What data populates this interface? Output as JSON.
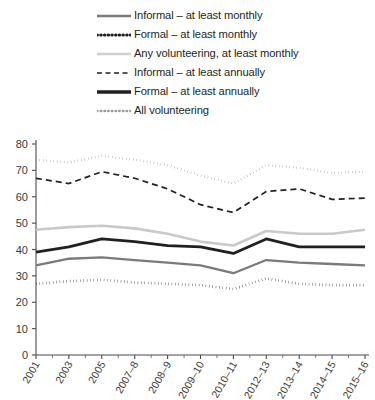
{
  "chart_data": {
    "type": "line",
    "title": "",
    "xlabel": "",
    "ylabel": "",
    "ylim": [
      0,
      80
    ],
    "ytick_step": 10,
    "grid": false,
    "legend_position": "top",
    "yticks": [
      "0",
      "10",
      "20",
      "30",
      "40",
      "50",
      "60",
      "70",
      "80"
    ],
    "categories": [
      "2001",
      "2003",
      "2005",
      "2007-8",
      "2008-9",
      "2009-10",
      "2010-11",
      "2012-13",
      "2013-14",
      "2014-15",
      "2015-16"
    ],
    "x_tick_labels": [
      "2001",
      "2003",
      "2005",
      "2007–8",
      "2008–9",
      "2009–10",
      "2010–11",
      "2012–13",
      "2013–14",
      "2014–15",
      "2015–16"
    ],
    "series": [
      {
        "name": "All volunteering",
        "style": "dotted",
        "color": "#8c8c8c",
        "width": 2.2,
        "dash": "0.4,3.1",
        "values": [
          74,
          73,
          75.5,
          74,
          72,
          68,
          65,
          72,
          71,
          69,
          69.5
        ]
      },
      {
        "name": "Informal – at least annually",
        "style": "dashed",
        "color": "#231f20",
        "width": 1.7,
        "dash": "6,4",
        "values": [
          67,
          65,
          69.5,
          67,
          63,
          57,
          54,
          62,
          63,
          59,
          59.5
        ]
      },
      {
        "name": "Any volunteering, at least monthly",
        "style": "solid",
        "color": "#c9c9c9",
        "width": 2.6,
        "dash": "",
        "values": [
          47.5,
          48.5,
          49,
          48,
          46,
          43,
          41.5,
          47,
          46,
          46,
          47.5
        ]
      },
      {
        "name": "Formal – at least annually",
        "style": "solid",
        "color": "#231f20",
        "width": 2.8,
        "dash": "",
        "values": [
          39,
          41,
          44,
          43,
          41.5,
          41,
          38.5,
          44,
          41,
          41,
          41
        ]
      },
      {
        "name": "Informal – at least monthly",
        "style": "solid",
        "color": "#7a7a7a",
        "width": 2.3,
        "dash": "",
        "values": [
          34,
          36.5,
          37,
          36,
          35,
          34,
          31,
          36,
          35,
          34.5,
          34
        ]
      },
      {
        "name": "Formal – at least monthly",
        "style": "dotted",
        "color": "#231f20",
        "width": 2.6,
        "dash": "0.4,3.0",
        "values": [
          27,
          28,
          28.5,
          27.5,
          27,
          26.5,
          25,
          29,
          27,
          26.5,
          26.5
        ]
      }
    ]
  },
  "legend": {
    "items": [
      {
        "label": "Informal – at least monthly",
        "swatch": "solid-gray-line",
        "color": "#7a7a7a",
        "style": "solid",
        "width": 2.6,
        "dash": ""
      },
      {
        "label": "Formal – at least monthly",
        "swatch": "dotted-black-line",
        "color": "#231f20",
        "style": "dotted",
        "width": 3,
        "dash": "0.5,3.2"
      },
      {
        "label": "Any volunteering, at least monthly",
        "swatch": "solid-lightgray-line",
        "color": "#cfcfcf",
        "style": "solid",
        "width": 2.6,
        "dash": ""
      },
      {
        "label": "Informal – at least annually",
        "swatch": "dashed-black-line",
        "color": "#231f20",
        "style": "dashed",
        "width": 1.6,
        "dash": "5,3.5"
      },
      {
        "label": "Formal – at least annually",
        "swatch": "solid-black-line",
        "color": "#231f20",
        "style": "solid",
        "width": 3.4,
        "dash": ""
      },
      {
        "label": "All volunteering",
        "swatch": "dotted-gray-line",
        "color": "#9a9a9a",
        "style": "dotted",
        "width": 2.4,
        "dash": "0.5,3.2"
      }
    ]
  }
}
